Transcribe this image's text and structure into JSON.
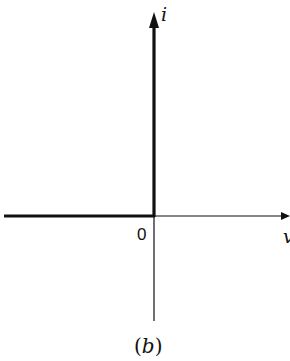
{
  "diagram": {
    "type": "i-v characteristic",
    "axes": {
      "x_label": "v",
      "y_label": "i",
      "origin_label": "0"
    },
    "caption": {
      "open": "(",
      "letter": "b",
      "close": ")"
    },
    "characteristic": {
      "description": "Thick curve along negative v-axis (i = 0 for v < 0) and along positive i-axis (v = 0 for i > 0) — ideal diode characteristic",
      "segments": [
        {
          "from": "v<0, i=0",
          "to": "origin"
        },
        {
          "from": "origin",
          "to": "v=0, i>0"
        }
      ]
    },
    "colors": {
      "line": "#111111",
      "background": "#ffffff"
    }
  }
}
